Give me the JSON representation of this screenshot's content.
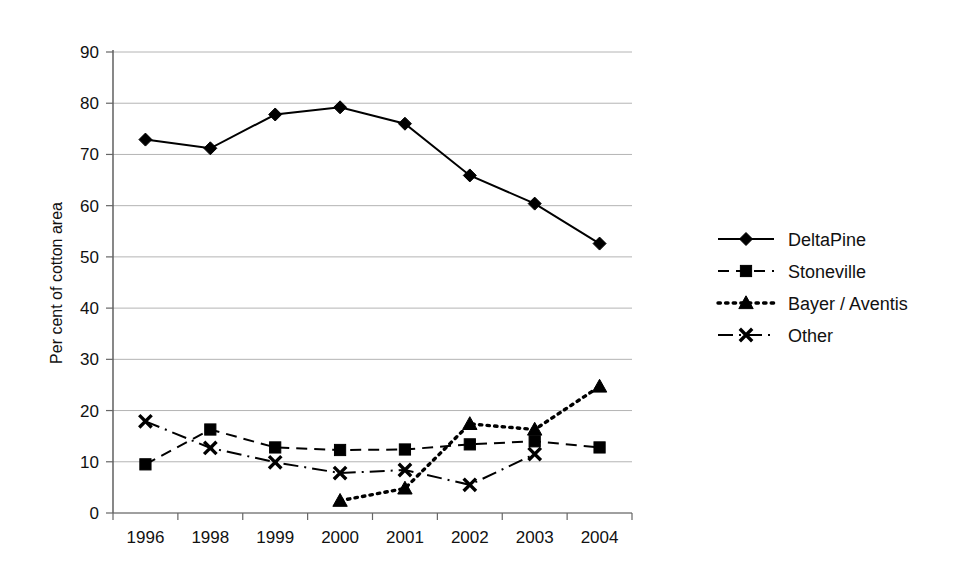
{
  "chart_data": {
    "type": "line",
    "title": "",
    "xlabel": "",
    "ylabel": "Per cent of cotton area",
    "categories": [
      "1996",
      "1998",
      "1999",
      "2000",
      "2001",
      "2002",
      "2003",
      "2004"
    ],
    "ylim": [
      0,
      90
    ],
    "yticks": [
      0,
      10,
      20,
      30,
      40,
      50,
      60,
      70,
      80,
      90
    ],
    "ytick_labels": [
      "0",
      "10",
      "20",
      "30",
      "40",
      "50",
      "60",
      "70",
      "80",
      "90"
    ],
    "grid": true,
    "grid_axis": "y",
    "legend_position": "right",
    "series": [
      {
        "name": "DeltaPine",
        "marker": "diamond",
        "line_style": "solid",
        "color": "#000000",
        "values": [
          72.9,
          71.2,
          77.8,
          79.2,
          76.0,
          65.9,
          60.4,
          52.6
        ]
      },
      {
        "name": "Stoneville",
        "marker": "square",
        "line_style": "dashed",
        "color": "#000000",
        "values": [
          9.5,
          16.3,
          12.8,
          12.3,
          12.4,
          13.4,
          14.0,
          12.8
        ]
      },
      {
        "name": "Bayer / Aventis",
        "marker": "triangle",
        "line_style": "dotted",
        "color": "#000000",
        "values": [
          null,
          null,
          null,
          2.4,
          4.8,
          17.4,
          16.3,
          24.7
        ]
      },
      {
        "name": "Other",
        "marker": "x",
        "line_style": "dashdot",
        "color": "#000000",
        "values": [
          17.9,
          12.7,
          9.9,
          7.8,
          8.4,
          5.5,
          11.5,
          null
        ]
      }
    ]
  },
  "axes": {
    "y_axis_title": "Per cent of cotton area"
  },
  "legend": {
    "entries": [
      {
        "label": "DeltaPine",
        "marker": "diamond",
        "line_style": "solid"
      },
      {
        "label": "Stoneville",
        "marker": "square",
        "line_style": "dashed"
      },
      {
        "label": "Bayer / Aventis",
        "marker": "triangle",
        "line_style": "dotted"
      },
      {
        "label": "Other",
        "marker": "x",
        "line_style": "dashdot"
      }
    ]
  }
}
